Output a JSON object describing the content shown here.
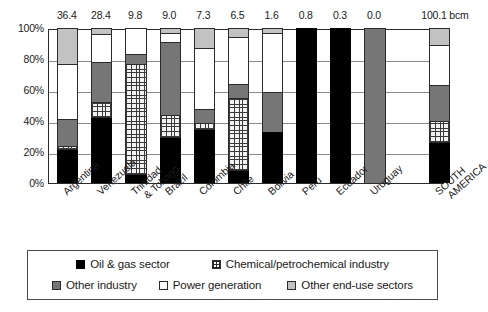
{
  "chart_data": {
    "type": "bar",
    "title": "",
    "subtitle": "",
    "xlabel": "",
    "ylabel": "",
    "ylim": [
      0,
      100
    ],
    "ytick_labels": [
      "0%",
      "20%",
      "40%",
      "60%",
      "80%",
      "100%"
    ],
    "ytick_values": [
      0,
      20,
      40,
      60,
      80,
      100
    ],
    "grid": true,
    "stacked": true,
    "normalized_percent": true,
    "legend_position": "bottom",
    "unit_label": "bcm",
    "categories": [
      "Argentina",
      "Venezuela",
      "Trinidad & Tobago",
      "Brazil",
      "Colombia",
      "Chile",
      "Bolivia",
      "Peru",
      "Ecuador",
      "Uruguay",
      "SOUTH AMERICA"
    ],
    "category_lines": [
      [
        "Argentina"
      ],
      [
        "Venezuela"
      ],
      [
        "Trinidad",
        "& Tobago"
      ],
      [
        "Brazil"
      ],
      [
        "Colombia"
      ],
      [
        "Chile"
      ],
      [
        "Bolivia"
      ],
      [
        "Peru"
      ],
      [
        "Ecuador"
      ],
      [
        "Uruguay"
      ],
      [
        "SOUTH",
        "AMERICA"
      ]
    ],
    "top_labels": [
      "36.4",
      "28.4",
      "9.8",
      "9.0",
      "7.3",
      "6.5",
      "1.6",
      "0.8",
      "0.3",
      "0.0",
      "100.1 bcm"
    ],
    "top_label_values": [
      36.4,
      28.4,
      9.8,
      9.0,
      7.3,
      6.5,
      1.6,
      0.8,
      0.3,
      0.0,
      100.1
    ],
    "series": [
      {
        "name": "Oil & gas sector",
        "key": "oilgas",
        "color": "#000000",
        "pattern": "solid-black",
        "values": [
          21,
          42,
          5,
          29,
          34,
          8,
          33,
          100,
          100,
          0,
          26
        ]
      },
      {
        "name": "Chemical/petrochemical industry",
        "key": "chem",
        "color": "#f2f2f2",
        "pattern": "crosshatch",
        "values": [
          3,
          10,
          72,
          15,
          5,
          47,
          0,
          0,
          0,
          0,
          14
        ]
      },
      {
        "name": "Other industry",
        "key": "otherind",
        "color": "#767676",
        "pattern": "solid-gray",
        "values": [
          17,
          26,
          6,
          47,
          9,
          9,
          26,
          0,
          0,
          100,
          23
        ]
      },
      {
        "name": "Power generation",
        "key": "power",
        "color": "#ffffff",
        "pattern": "solid-white",
        "values": [
          36,
          18,
          17,
          6,
          39,
          30,
          38,
          0,
          0,
          0,
          26
        ]
      },
      {
        "name": "Other end-use sectors",
        "key": "enduse",
        "color": "#c2c2c2",
        "pattern": "solid-lightgray",
        "values": [
          23,
          4,
          0,
          3,
          13,
          6,
          3,
          0,
          0,
          0,
          11
        ]
      }
    ]
  },
  "legend": {
    "row1": [
      "Oil & gas sector",
      "Chemical/petrochemical industry"
    ],
    "row2": [
      "Other industry",
      "Power generation",
      "Other end-use sectors"
    ]
  }
}
